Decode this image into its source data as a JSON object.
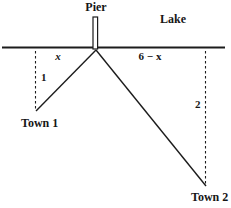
{
  "figure": {
    "title_context": "pier-lake-towns-distance-diagram",
    "background_color": "#ffffff",
    "line_color": "#1c1c1c",
    "labels": {
      "pier": "Pier",
      "lake": "Lake",
      "left_segment": "x",
      "right_segment": "6 − x",
      "town1_depth": "1",
      "town2_depth": "2",
      "town1": "Town 1",
      "town2": "Town 2"
    },
    "geometry_notes": {
      "shoreline_total": "6",
      "pier_to_town1_horizontal": "x",
      "pier_to_town2_horizontal": "6 − x",
      "town1_vertical_distance": "1",
      "town2_vertical_distance": "2"
    }
  }
}
